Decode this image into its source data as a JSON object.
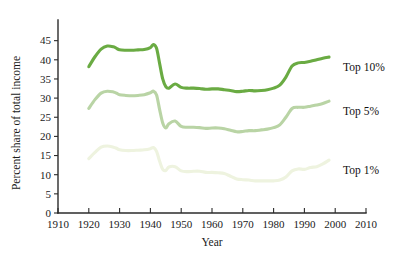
{
  "chart_data": {
    "type": "line",
    "title": "",
    "xlabel": "Year",
    "ylabel": "Percent share of total income",
    "xlim": [
      1910,
      2010
    ],
    "ylim": [
      0,
      47
    ],
    "grid": false,
    "legend_position": "inline-right",
    "xticks": [
      1910,
      1920,
      1930,
      1940,
      1950,
      1960,
      1970,
      1980,
      1990,
      2000,
      2010
    ],
    "yticks": [
      0,
      5,
      10,
      15,
      20,
      25,
      30,
      35,
      40,
      45
    ],
    "colors": {
      "top10": "#6aab43",
      "top5": "#b9d4a5",
      "top1": "#eef3df"
    },
    "series": [
      {
        "name": "Top 10%",
        "color": "#6aab43",
        "label": "Top 10%",
        "x": [
          1920,
          1922,
          1924,
          1926,
          1928,
          1929,
          1930,
          1932,
          1934,
          1936,
          1938,
          1940,
          1941,
          1942,
          1943,
          1944,
          1945,
          1946,
          1948,
          1950,
          1952,
          1954,
          1956,
          1958,
          1960,
          1962,
          1964,
          1966,
          1968,
          1970,
          1972,
          1974,
          1976,
          1978,
          1980,
          1982,
          1984,
          1986,
          1988,
          1990,
          1992,
          1994,
          1996,
          1998
        ],
        "values": [
          38.2,
          40.8,
          42.8,
          43.6,
          43.4,
          43.0,
          42.6,
          42.5,
          42.5,
          42.6,
          42.7,
          43.2,
          44.0,
          43.0,
          39.0,
          35.0,
          33.0,
          32.6,
          33.7,
          32.8,
          32.6,
          32.6,
          32.5,
          32.3,
          32.4,
          32.4,
          32.2,
          32.0,
          31.7,
          31.8,
          32.0,
          31.9,
          32.0,
          32.2,
          32.6,
          33.4,
          35.5,
          38.4,
          39.2,
          39.3,
          39.6,
          40.0,
          40.4,
          40.7
        ]
      },
      {
        "name": "Top 5%",
        "color": "#b9d4a5",
        "label": "Top 5%",
        "x": [
          1920,
          1922,
          1924,
          1926,
          1928,
          1929,
          1930,
          1932,
          1934,
          1936,
          1938,
          1940,
          1941,
          1942,
          1943,
          1944,
          1945,
          1946,
          1948,
          1950,
          1952,
          1954,
          1956,
          1958,
          1960,
          1962,
          1964,
          1966,
          1968,
          1970,
          1972,
          1974,
          1976,
          1978,
          1980,
          1982,
          1984,
          1986,
          1988,
          1990,
          1992,
          1994,
          1996,
          1998
        ],
        "values": [
          27.3,
          29.6,
          31.3,
          31.8,
          31.6,
          31.3,
          30.9,
          30.7,
          30.6,
          30.7,
          30.9,
          31.4,
          31.8,
          30.8,
          27.0,
          23.5,
          22.2,
          23.3,
          24.0,
          22.6,
          22.4,
          22.4,
          22.3,
          22.1,
          22.2,
          22.2,
          22.0,
          21.6,
          21.2,
          21.3,
          21.5,
          21.5,
          21.7,
          21.9,
          22.3,
          23.0,
          25.0,
          27.3,
          27.6,
          27.6,
          27.9,
          28.2,
          28.6,
          29.2
        ]
      },
      {
        "name": "Top 1%",
        "color": "#eef3df",
        "label": "Top 1%",
        "x": [
          1920,
          1922,
          1924,
          1926,
          1928,
          1929,
          1930,
          1932,
          1934,
          1936,
          1938,
          1940,
          1941,
          1942,
          1943,
          1944,
          1945,
          1946,
          1948,
          1950,
          1952,
          1954,
          1956,
          1958,
          1960,
          1962,
          1964,
          1966,
          1968,
          1970,
          1972,
          1974,
          1976,
          1978,
          1980,
          1982,
          1984,
          1986,
          1988,
          1990,
          1992,
          1994,
          1996,
          1998
        ],
        "values": [
          14.2,
          15.8,
          17.2,
          17.5,
          17.2,
          16.9,
          16.5,
          16.3,
          16.3,
          16.4,
          16.5,
          16.8,
          17.1,
          16.1,
          13.5,
          11.4,
          11.1,
          12.0,
          12.1,
          11.0,
          10.8,
          10.9,
          10.9,
          10.6,
          10.6,
          10.5,
          10.3,
          9.6,
          8.9,
          8.7,
          8.6,
          8.4,
          8.4,
          8.4,
          8.4,
          8.6,
          9.4,
          11.0,
          11.5,
          11.4,
          11.9,
          12.1,
          12.8,
          13.8
        ]
      }
    ]
  }
}
